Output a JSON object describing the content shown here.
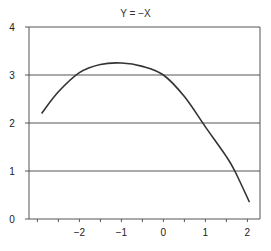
{
  "chart_data": {
    "type": "line",
    "title": "Y = −X",
    "xlabel": "",
    "ylabel": "",
    "xlim": [
      -3.2,
      2.3
    ],
    "ylim": [
      0,
      4
    ],
    "x_ticks": [
      -2,
      -1,
      0,
      1,
      2
    ],
    "x_tick_labels": [
      "−2",
      "−1",
      "0",
      "1",
      "2"
    ],
    "y_ticks": [
      0,
      1,
      2,
      3,
      4
    ],
    "y_tick_labels": [
      "0",
      "1",
      "2",
      "3",
      "4"
    ],
    "grid": {
      "horizontal": true,
      "vertical": false
    },
    "legend": null,
    "series": [
      {
        "name": "Y",
        "color": "#333333",
        "x": [
          -2.9,
          -2.5,
          -2.0,
          -1.5,
          -1.0,
          -0.5,
          0.0,
          0.5,
          1.0,
          1.5,
          1.7,
          2.05
        ],
        "values": [
          2.2,
          2.65,
          3.05,
          3.22,
          3.25,
          3.18,
          3.0,
          2.55,
          1.92,
          1.3,
          1.0,
          0.35
        ]
      }
    ]
  }
}
